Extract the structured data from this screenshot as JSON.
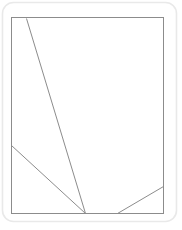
{
  "canvas": {
    "width": 182,
    "height": 230,
    "background_color": "#ffffff"
  },
  "outer_container": {
    "label": "rounded-card-border",
    "x": 2.5,
    "y": 2.5,
    "width": 174,
    "height": 219,
    "corner_radius": 11,
    "stroke_color": "#e9e9e9",
    "fill_color": "#ffffff",
    "stroke_width": 1.6
  },
  "figure": {
    "title": "",
    "stroke_color": "#8c8c8c",
    "stroke_width": 1,
    "fill_color": "#ffffff",
    "frame": {
      "label": "plot-rectangle",
      "left": 11,
      "top": 17,
      "right": 163,
      "bottom": 213,
      "width": 152,
      "height": 196
    },
    "convergence_point": {
      "label": "apex",
      "x": 85,
      "y": 213
    },
    "lines": [
      {
        "name": "long-diagonal",
        "x1": 26,
        "y1": 18,
        "x2": 85,
        "y2": 213,
        "from_edge": "top",
        "to_edge": "bottom"
      },
      {
        "name": "left-diagonal",
        "x1": 11,
        "y1": 145,
        "x2": 85,
        "y2": 213,
        "from_edge": "left",
        "to_edge": "bottom"
      },
      {
        "name": "right-diagonal",
        "x1": 117,
        "y1": 213,
        "x2": 163,
        "y2": 186,
        "from_edge": "bottom",
        "to_edge": "right"
      }
    ]
  }
}
